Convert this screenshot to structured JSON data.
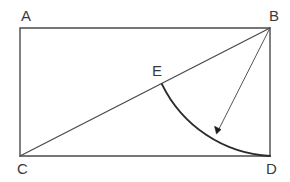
{
  "figure": {
    "background_color": "#ffffff",
    "stroke_color": "#4a4a4a",
    "arc_color": "#2b2b2b",
    "label_color": "#3a3a3a",
    "canvas": {
      "width": 290,
      "height": 182
    },
    "rectangle": {
      "name": "rectangle-ABDC",
      "top_left": {
        "x": 20,
        "y": 28
      },
      "top_right": {
        "x": 270,
        "y": 28
      },
      "bottom_right": {
        "x": 270,
        "y": 156
      },
      "bottom_left": {
        "x": 20,
        "y": 156
      },
      "width": 250,
      "height": 128,
      "path": "M 20 28 L 270 28 L 270 156 L 20 156 Z"
    },
    "diagonal": {
      "name": "diagonal-CB",
      "from": {
        "x": 20,
        "y": 156
      },
      "to": {
        "x": 270,
        "y": 28
      },
      "path": "M 20 156 L 270 28"
    },
    "arc": {
      "name": "arc-E-to-D",
      "center": {
        "x": 270,
        "y": 28
      },
      "radius": 128,
      "start": {
        "x": 161.9,
        "y": 84.1
      },
      "end": {
        "x": 270,
        "y": 156
      },
      "path": "M 161.9 84.1 A 128 128 0 0 0 270 156"
    },
    "radius_arrow": {
      "name": "radius-arrow-B-to-arc",
      "from": {
        "x": 270,
        "y": 28
      },
      "to": {
        "x": 216.5,
        "y": 133.9
      },
      "line_path": "M 270 28 L 217.8 131.3",
      "head_path": "M 216.5 133.9 L 214.6 126.3 L 221.0 129.5 Z"
    },
    "labels": [
      {
        "id": "A",
        "text": "A",
        "x": 21,
        "y": 21,
        "anchor": "start"
      },
      {
        "id": "B",
        "text": "B",
        "x": 269,
        "y": 21,
        "anchor": "start"
      },
      {
        "id": "C",
        "text": "C",
        "x": 17,
        "y": 174,
        "anchor": "start"
      },
      {
        "id": "D",
        "text": "D",
        "x": 266,
        "y": 174,
        "anchor": "start"
      },
      {
        "id": "E",
        "text": "E",
        "x": 152,
        "y": 76,
        "anchor": "start"
      }
    ]
  }
}
